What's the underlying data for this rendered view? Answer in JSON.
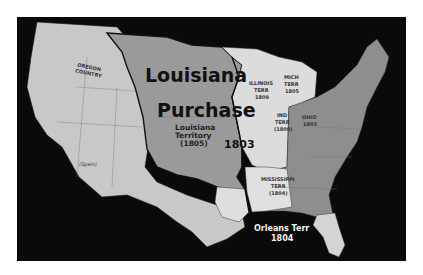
{
  "map": {
    "title": "Louisiana Purchase",
    "colors": {
      "ocean": "#0a0a0a",
      "louisiana_purchase": "#9a9a9a",
      "western_territories": "#c8c8c8",
      "us_states_east": "#8e8e8e",
      "territories_light": "#dcdcdc",
      "boundary": "#1a1a1a"
    },
    "labels": {
      "main_title_line1": "Louisiana",
      "main_title_line2": "Purchase",
      "territory_line1": "Louisiana",
      "territory_line2": "Territory",
      "territory_year": "(1805)",
      "purchase_year": "1803",
      "oregon_line1": "OREGON",
      "oregon_line2": "COUNTRY",
      "spain": "(Spain)",
      "illinois_line1": "ILLINOIS",
      "illinois_line2": "TERR",
      "illinois_year": "1809",
      "michigan_line1": "MICH",
      "michigan_line2": "TERR",
      "michigan_year": "1805",
      "indiana_line1": "IND",
      "indiana_line2": "TERR",
      "indiana_year": "(1800)",
      "ohio_line1": "OHIO",
      "ohio_year": "1803",
      "mississippi_line1": "MISSISSIPPI",
      "mississippi_line2": "TERR",
      "mississippi_year": "(1804)",
      "orleans_line1": "Orleans Terr",
      "orleans_year": "1804"
    }
  }
}
